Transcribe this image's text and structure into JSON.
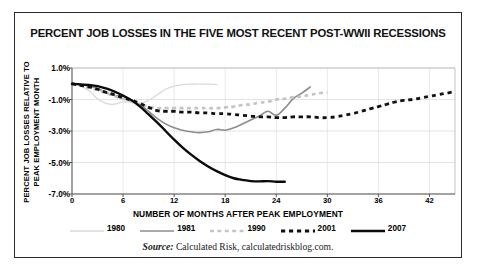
{
  "title": "PERCENT JOB LOSSES IN THE FIVE MOST RECENT POST-WWII RECESSIONS",
  "source": {
    "prefix": "Source:",
    "text": "Calculated Risk, calculatedriskblog.com."
  },
  "axes": {
    "ylabel_line1": "PERCENT JOB LOSSES RELATIVE TO",
    "ylabel_line2": "PEAK EMPLOYMENT MONTH",
    "xlabel": "NUMBER OF MONTHS AFTER PEAK EMPLOYMENT",
    "yticks": [
      "1.0%",
      "-1.0%",
      "-3.0%",
      "-5.0%",
      "-7.0%"
    ],
    "xticks": [
      "0",
      "6",
      "12",
      "18",
      "24",
      "30",
      "36",
      "42"
    ]
  },
  "legend": [
    {
      "label": "1980",
      "color": "#d9d9d9",
      "style": "solid",
      "width": 1.3
    },
    {
      "label": "1981",
      "color": "#8c8c8c",
      "style": "solid",
      "width": 1.6
    },
    {
      "label": "1990",
      "color": "#c4c4c4",
      "style": "dashed",
      "width": 2.6
    },
    {
      "label": "2001",
      "color": "#111111",
      "style": "dashed",
      "width": 2.8
    },
    {
      "label": "2007",
      "color": "#0a0a0a",
      "style": "solid",
      "width": 2.4
    }
  ],
  "chart_data": {
    "type": "line",
    "title": "PERCENT JOB LOSSES IN THE FIVE MOST RECENT POST-WWII RECESSIONS",
    "xlabel": "NUMBER OF MONTHS AFTER PEAK EMPLOYMENT",
    "ylabel": "PERCENT JOB LOSSES RELATIVE TO PEAK EMPLOYMENT MONTH",
    "xlim": [
      0,
      45
    ],
    "ylim": [
      -7.0,
      1.0
    ],
    "xticks": [
      0,
      6,
      12,
      18,
      24,
      30,
      36,
      42
    ],
    "yticks": [
      1.0,
      -1.0,
      -3.0,
      -5.0,
      -7.0
    ],
    "grid": true,
    "legend_position": "bottom",
    "units": "percent",
    "series": [
      {
        "name": "1980",
        "color": "#d9d9d9",
        "style": "solid",
        "x": [
          0,
          1,
          2,
          3,
          4,
          5,
          6,
          7,
          8,
          9,
          10,
          11,
          12,
          13,
          14,
          15,
          16,
          17
        ],
        "values": [
          0.0,
          -0.15,
          -0.45,
          -0.95,
          -1.25,
          -1.3,
          -1.15,
          -1.2,
          -1.25,
          -1.05,
          -0.7,
          -0.35,
          -0.15,
          -0.05,
          -0.02,
          -0.02,
          -0.03,
          -0.05
        ]
      },
      {
        "name": "1981",
        "color": "#8c8c8c",
        "style": "solid",
        "x": [
          0,
          1,
          2,
          3,
          4,
          5,
          6,
          7,
          8,
          9,
          10,
          11,
          12,
          13,
          14,
          15,
          16,
          17,
          18,
          19,
          20,
          21,
          22,
          23,
          24,
          25,
          26,
          27,
          28
        ],
        "values": [
          0.0,
          -0.05,
          -0.15,
          -0.3,
          -0.55,
          -0.75,
          -0.8,
          -1.05,
          -1.35,
          -1.75,
          -2.2,
          -2.55,
          -2.8,
          -2.95,
          -3.05,
          -3.1,
          -3.05,
          -2.9,
          -2.95,
          -2.8,
          -2.55,
          -2.3,
          -2.05,
          -1.75,
          -2.0,
          -1.55,
          -0.95,
          -0.6,
          -0.2
        ]
      },
      {
        "name": "1990",
        "color": "#c4c4c4",
        "style": "dashed",
        "x": [
          0,
          1,
          2,
          3,
          4,
          5,
          6,
          7,
          8,
          9,
          10,
          11,
          12,
          13,
          14,
          15,
          16,
          17,
          18,
          19,
          20,
          21,
          22,
          23,
          24,
          25,
          26,
          27,
          28,
          29,
          30
        ],
        "values": [
          0.0,
          -0.1,
          -0.25,
          -0.4,
          -0.6,
          -0.8,
          -0.95,
          -1.1,
          -1.3,
          -1.45,
          -1.55,
          -1.55,
          -1.55,
          -1.55,
          -1.55,
          -1.55,
          -1.55,
          -1.55,
          -1.5,
          -1.45,
          -1.35,
          -1.3,
          -1.2,
          -1.15,
          -1.0,
          -0.95,
          -0.85,
          -0.8,
          -0.7,
          -0.6,
          -0.55
        ]
      },
      {
        "name": "2001",
        "color": "#111111",
        "style": "dashed",
        "x": [
          0,
          1,
          2,
          3,
          4,
          5,
          6,
          7,
          8,
          9,
          10,
          11,
          12,
          13,
          14,
          15,
          16,
          17,
          18,
          19,
          20,
          21,
          22,
          23,
          24,
          25,
          26,
          27,
          28,
          29,
          30,
          31,
          32,
          33,
          34,
          35,
          36,
          37,
          38,
          39,
          40,
          41,
          42,
          43,
          44,
          45
        ],
        "values": [
          0.0,
          -0.1,
          -0.2,
          -0.35,
          -0.55,
          -0.7,
          -0.9,
          -1.05,
          -1.25,
          -1.5,
          -1.7,
          -1.75,
          -1.75,
          -1.8,
          -1.8,
          -1.85,
          -1.85,
          -1.9,
          -1.9,
          -1.95,
          -2.0,
          -2.05,
          -2.1,
          -2.1,
          -2.15,
          -2.15,
          -2.1,
          -2.1,
          -2.1,
          -2.15,
          -2.15,
          -2.1,
          -2.0,
          -1.9,
          -1.75,
          -1.6,
          -1.45,
          -1.3,
          -1.15,
          -1.05,
          -1.0,
          -0.9,
          -0.8,
          -0.7,
          -0.6,
          -0.5
        ]
      },
      {
        "name": "2007",
        "color": "#0a0a0a",
        "style": "solid",
        "x": [
          0,
          1,
          2,
          3,
          4,
          5,
          6,
          7,
          8,
          9,
          10,
          11,
          12,
          13,
          14,
          15,
          16,
          17,
          18,
          19,
          20,
          21,
          22,
          23,
          24,
          25
        ],
        "values": [
          0.0,
          -0.05,
          -0.08,
          -0.15,
          -0.3,
          -0.5,
          -0.75,
          -1.05,
          -1.45,
          -1.95,
          -2.45,
          -3.0,
          -3.55,
          -4.05,
          -4.5,
          -4.9,
          -5.25,
          -5.55,
          -5.8,
          -6.0,
          -6.1,
          -6.18,
          -6.2,
          -6.18,
          -6.22,
          -6.22
        ]
      }
    ]
  }
}
